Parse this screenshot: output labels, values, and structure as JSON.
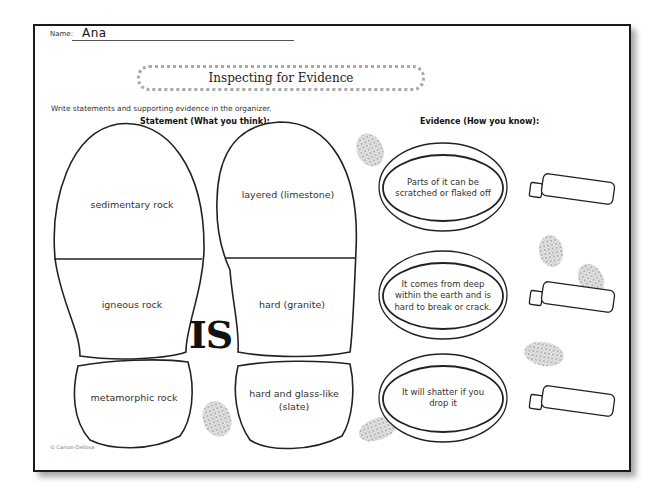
{
  "worksheet": {
    "name_label": "Name:",
    "name_value": "Ana",
    "title": "Inspecting for Evidence",
    "instructions": "Write statements and supporting evidence in the organizer.",
    "statement_heading": "Statement (What you think):",
    "evidence_heading": "Evidence (How you know):",
    "connector_word": "IS",
    "copyright": "© Carson-Dellosa"
  },
  "left_footprint": [
    {
      "text": "sedimentary rock"
    },
    {
      "text": "igneous rock"
    },
    {
      "text": "metamorphic rock"
    }
  ],
  "right_footprint": [
    {
      "text": "layered (limestone)"
    },
    {
      "text": "hard (granite)"
    },
    {
      "text": "hard and glass-like (slate)"
    }
  ],
  "evidence": [
    {
      "text": "Parts of it can be scratched or flaked off"
    },
    {
      "text": "It comes from deep within the earth and is hard to break or crack."
    },
    {
      "text": "It will shatter if you drop it"
    }
  ],
  "icons": {
    "footprint": "footprint-outline",
    "magnifier": "magnifying-glass",
    "fingerprint": "fingerprint-smudge"
  }
}
